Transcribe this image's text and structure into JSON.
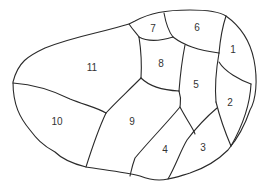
{
  "diagram": {
    "type": "numbered-region-map",
    "colors": {
      "stroke": "#2a2a2a",
      "label": "#333333",
      "background": "#ffffff"
    },
    "regions": [
      {
        "id": "1",
        "label": "1",
        "x": 233,
        "y": 49
      },
      {
        "id": "2",
        "label": "2",
        "x": 230,
        "y": 102
      },
      {
        "id": "3",
        "label": "3",
        "x": 203,
        "y": 147
      },
      {
        "id": "4",
        "label": "4",
        "x": 165,
        "y": 149
      },
      {
        "id": "5",
        "label": "5",
        "x": 196,
        "y": 84
      },
      {
        "id": "6",
        "label": "6",
        "x": 197,
        "y": 27
      },
      {
        "id": "7",
        "label": "7",
        "x": 153,
        "y": 28
      },
      {
        "id": "8",
        "label": "8",
        "x": 161,
        "y": 63
      },
      {
        "id": "9",
        "label": "9",
        "x": 132,
        "y": 121
      },
      {
        "id": "10",
        "label": "10",
        "x": 57,
        "y": 121
      },
      {
        "id": "11",
        "label": "11",
        "x": 92,
        "y": 67
      }
    ]
  }
}
